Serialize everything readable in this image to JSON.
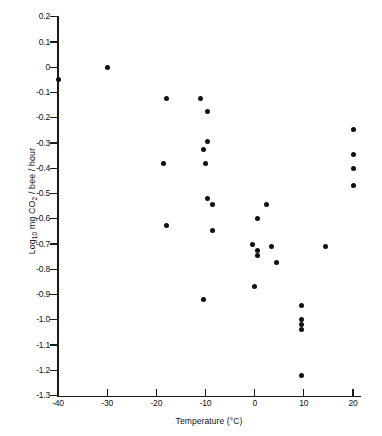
{
  "chart_data": {
    "type": "scatter",
    "title": "",
    "xlabel": "Temperature (°C)",
    "ylabel": "Log10 mg CO2 / bee / hour",
    "ylabel_parts": {
      "prefix": "Log",
      "sub1": "10",
      "mid": " mg CO",
      "sub2": "2",
      "suffix": " / bee / hour"
    },
    "xlim": [
      -42,
      23
    ],
    "ylim": [
      -1.3,
      0.2
    ],
    "xticks": [
      -40,
      -30,
      -20,
      -10,
      0,
      10,
      20
    ],
    "xtick_labels": [
      "-40",
      "-30",
      "-20",
      "-10",
      "0",
      "10",
      "20"
    ],
    "yticks": [
      0.2,
      0.1,
      0.0,
      -0.1,
      -0.2,
      -0.3,
      -0.4,
      -0.5,
      -0.6,
      -0.7,
      -0.8,
      -0.9,
      -1.0,
      -1.1,
      -1.2,
      -1.3
    ],
    "ytick_labels": [
      "0.2",
      "0.1",
      "0",
      "-0.1",
      "-0.2",
      "-0.3",
      "-0.4",
      "-0.5",
      "-0.6",
      "-0.7",
      "-0.8",
      "-0.9",
      "-1.0",
      "-1.1",
      "-1.2",
      "-1.3"
    ],
    "grid": false,
    "legend": null,
    "marker": "filled-circle",
    "marker_color": "#101010",
    "points": [
      {
        "x": -40.0,
        "y": -0.05
      },
      {
        "x": -30.0,
        "y": 0.0
      },
      {
        "x": -18.0,
        "y": -0.125
      },
      {
        "x": -18.5,
        "y": -0.38
      },
      {
        "x": -18.0,
        "y": -0.625
      },
      {
        "x": -11.0,
        "y": -0.125
      },
      {
        "x": -9.5,
        "y": -0.175
      },
      {
        "x": -10.5,
        "y": -0.325
      },
      {
        "x": -9.5,
        "y": -0.295
      },
      {
        "x": -10.0,
        "y": -0.38
      },
      {
        "x": -9.5,
        "y": -0.52
      },
      {
        "x": -8.5,
        "y": -0.545
      },
      {
        "x": -8.5,
        "y": -0.645
      },
      {
        "x": -10.5,
        "y": -0.92
      },
      {
        "x": 0.5,
        "y": -0.6
      },
      {
        "x": 2.5,
        "y": -0.545
      },
      {
        "x": -0.5,
        "y": -0.7
      },
      {
        "x": 0.5,
        "y": -0.725
      },
      {
        "x": 0.5,
        "y": -0.745
      },
      {
        "x": 3.5,
        "y": -0.71
      },
      {
        "x": 4.5,
        "y": -0.775
      },
      {
        "x": 0.0,
        "y": -0.87
      },
      {
        "x": 9.5,
        "y": -0.945
      },
      {
        "x": 9.5,
        "y": -1.0
      },
      {
        "x": 9.5,
        "y": -1.02
      },
      {
        "x": 9.5,
        "y": -1.04
      },
      {
        "x": 9.5,
        "y": -1.22
      },
      {
        "x": 14.5,
        "y": -0.71
      },
      {
        "x": 20.0,
        "y": -0.245
      },
      {
        "x": 20.0,
        "y": -0.345
      },
      {
        "x": 20.0,
        "y": -0.4
      },
      {
        "x": 20.0,
        "y": -0.47
      }
    ]
  }
}
